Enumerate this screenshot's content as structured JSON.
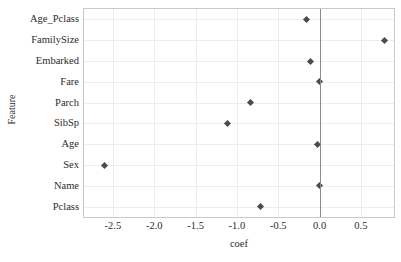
{
  "chart_data": {
    "type": "scatter",
    "title": "",
    "xlabel": "coef",
    "ylabel": "Feature",
    "xlim": [
      -2.85,
      0.9
    ],
    "ylim": [
      -0.5,
      9.5
    ],
    "grid": true,
    "legend": null,
    "orientation": "horizontal",
    "reference_line": {
      "axis": "x",
      "value": 0.0,
      "color": "#8a8a90"
    },
    "xticks": [
      "-2.5",
      "-2.0",
      "-1.5",
      "-1.0",
      "-0.5",
      "0.0",
      "0.5"
    ],
    "xtick_values": [
      -2.5,
      -2.0,
      -1.5,
      -1.0,
      -0.5,
      0.0,
      0.5
    ],
    "categories": [
      "Age_Pclass",
      "FamilySize",
      "Embarked",
      "Fare",
      "Parch",
      "SibSp",
      "Age",
      "Sex",
      "Name",
      "Pclass"
    ],
    "values": [
      -0.16,
      0.78,
      -0.11,
      0.0,
      -0.83,
      -1.11,
      -0.02,
      -2.6,
      0.0,
      -0.72
    ],
    "marker": {
      "shape": "diamond",
      "color": "#4a4a52",
      "size": 5
    }
  },
  "colors": {
    "background": "#ffffff",
    "frame": "#c9c9cc",
    "grid": "#ededf0",
    "marker": "#4a4a52",
    "zero_line": "#8a8a90",
    "text": "#2b2b2b"
  }
}
